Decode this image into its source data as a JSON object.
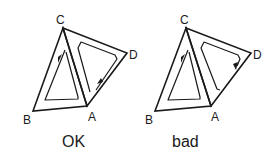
{
  "diagrams": [
    {
      "caption": "OK",
      "vertices": {
        "A": "A",
        "B": "B",
        "C": "C",
        "D": "D"
      },
      "description": "Consistent orientation: both triangle loops traverse the shared edge CA in opposite directions"
    },
    {
      "caption": "bad",
      "vertices": {
        "A": "A",
        "B": "B",
        "C": "C",
        "D": "D"
      },
      "description": "Inconsistent orientation: triangle CAD loop reversed"
    }
  ],
  "colors": {
    "stroke": "#1a1a1a",
    "background": "#ffffff"
  }
}
